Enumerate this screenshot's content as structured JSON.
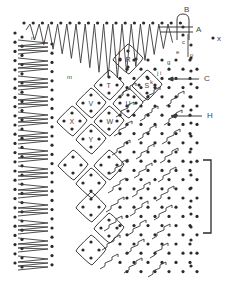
{
  "diagram": {
    "type": "bobbin-lace-pricking",
    "colors": {
      "ink": "#2a2a2a",
      "label": "#444444",
      "background": "#ffffff"
    },
    "labels": {
      "callouts": [
        {
          "id": "A",
          "text": "A",
          "x": 196,
          "y": 32
        },
        {
          "id": "B",
          "text": "B",
          "x": 184,
          "y": 12
        },
        {
          "id": "C",
          "text": "C",
          "x": 204,
          "y": 81
        },
        {
          "id": "H",
          "text": "H",
          "x": 207,
          "y": 118
        },
        {
          "id": "x",
          "text": "x",
          "x": 217,
          "y": 41
        }
      ],
      "pins": [
        {
          "text": "c",
          "x": 182,
          "y": 44
        },
        {
          "text": "e",
          "x": 176,
          "y": 54
        },
        {
          "text": "o",
          "x": 190,
          "y": 57
        },
        {
          "text": "g",
          "x": 167,
          "y": 64
        },
        {
          "text": "f",
          "x": 118,
          "y": 55
        },
        {
          "text": "i",
          "x": 160,
          "y": 75
        },
        {
          "text": "j",
          "x": 157,
          "y": 75
        },
        {
          "text": "k",
          "x": 150,
          "y": 84
        },
        {
          "text": "m",
          "x": 67,
          "y": 79
        },
        {
          "text": "n",
          "x": 31,
          "y": 40
        }
      ],
      "diamonds": [
        "R",
        "S",
        "T",
        "U",
        "V",
        "W",
        "X",
        "Y"
      ]
    },
    "bracket": {
      "top": 160,
      "bottom": 233,
      "x": 211
    }
  }
}
